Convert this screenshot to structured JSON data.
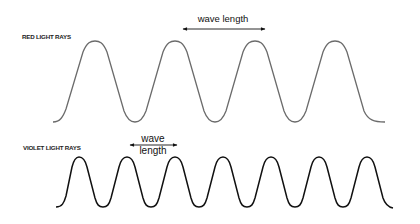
{
  "diagram": {
    "red": {
      "label": "RED LIGHT RAYS",
      "wavelength_label": "wave length",
      "stroke_color": "#6b6b6b",
      "cycles": 4
    },
    "violet": {
      "label": "VIOLET LIGHT RAYS",
      "wavelength_label_line1": "wave",
      "wavelength_label_line2": "length",
      "stroke_color": "#111111",
      "cycles": 7
    }
  }
}
